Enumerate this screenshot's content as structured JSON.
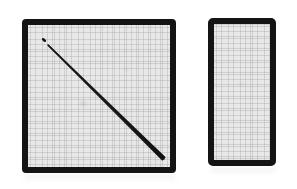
{
  "figure": {
    "background_color": "#ffffff",
    "canvas_width": 297,
    "canvas_height": 189,
    "caption": ""
  },
  "panels": [
    {
      "id": "square-panel",
      "label": "",
      "shape": "square",
      "frame_color": "#141414",
      "fill_color": "#e8e8e8",
      "frame_thickness_px": 6,
      "x": 22,
      "y": 19,
      "width": 154,
      "height": 154,
      "texture": "graph-paper-grid",
      "contents": "diagonal-line"
    },
    {
      "id": "rectangle-panel",
      "label": "",
      "shape": "rectangle",
      "frame_color": "#141414",
      "fill_color": "#e8e8e8",
      "frame_thickness_px": 6,
      "x": 208,
      "y": 18,
      "width": 68,
      "height": 148,
      "texture": "graph-paper-grid",
      "contents": "empty"
    }
  ],
  "annotations": {
    "diagonal_line": {
      "name": "diagonal-line",
      "color": "#141414",
      "start_x": 20,
      "start_y": 20,
      "end_x": 136,
      "end_y": 134,
      "stroke_width_start": 1.2,
      "stroke_width_end": 3.4,
      "direction": "top-left-to-bottom-right"
    },
    "start_dot": {
      "name": "line-start-dot",
      "color": "#141414",
      "x": 16,
      "y": 15,
      "width": 5,
      "height": 3,
      "rotation_deg": 42
    }
  },
  "colors": {
    "frame": "#141414",
    "panel_fill": "#e8e8e8",
    "grid_line": "#969696",
    "background": "#ffffff",
    "line": "#141414"
  }
}
